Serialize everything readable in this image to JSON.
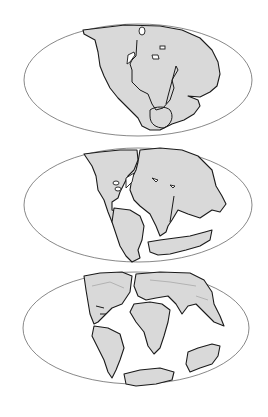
{
  "figure": {
    "title": "",
    "panels": [
      {
        "id": "map-1",
        "label": "",
        "description": "Supercontinent Pangaea assembled as one landmass"
      },
      {
        "id": "map-2",
        "label": "",
        "description": "Pangaea breaking apart; Laurasia and Gondwana separating"
      },
      {
        "id": "map-3",
        "label": "",
        "description": "Continents approaching modern positions; Atlantic opening"
      }
    ],
    "colors": {
      "land": "#d9d9d9",
      "ocean": "#ffffff",
      "coastline": "#1a1a1a",
      "globe_outline": "#555555"
    }
  }
}
